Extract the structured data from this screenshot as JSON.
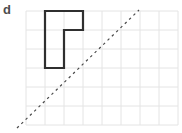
{
  "figure": {
    "label": "d",
    "colors": {
      "bg": "#ffffff",
      "grid": "#e4e4e4",
      "shape": "#2f2f2f",
      "mirror": "#4a4a4a",
      "label": "#4d4d4d"
    },
    "grid": {
      "x": 26,
      "y": 11,
      "cols": 8,
      "rows": 6,
      "cell": 19
    },
    "shape": {
      "points": "45,11 83,11 83,30 64,30 64,68 45,68"
    },
    "mirror_line": {
      "path": "M17,128 L139,10"
    }
  }
}
